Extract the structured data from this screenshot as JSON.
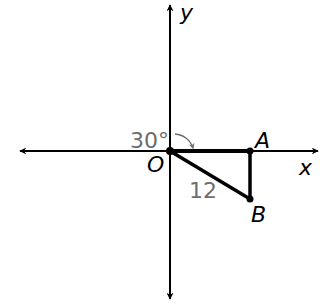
{
  "diagram": {
    "type": "coordinate-plane-rotation",
    "axes": {
      "x_label": "x",
      "y_label": "y"
    },
    "points": [
      {
        "name": "O",
        "label": "O",
        "x": 170,
        "y": 151
      },
      {
        "name": "A",
        "label": "A",
        "x": 250,
        "y": 151
      },
      {
        "name": "B",
        "label": "B",
        "x": 250,
        "y": 199
      }
    ],
    "segments": [
      {
        "from": "O",
        "to": "A"
      },
      {
        "from": "A",
        "to": "B"
      },
      {
        "from": "O",
        "to": "B"
      }
    ],
    "annotations": {
      "angle_label": "30°",
      "length_label": "12"
    },
    "colors": {
      "line": "#000000",
      "annotation": "#6d6d6d",
      "background": "#ffffff"
    }
  }
}
